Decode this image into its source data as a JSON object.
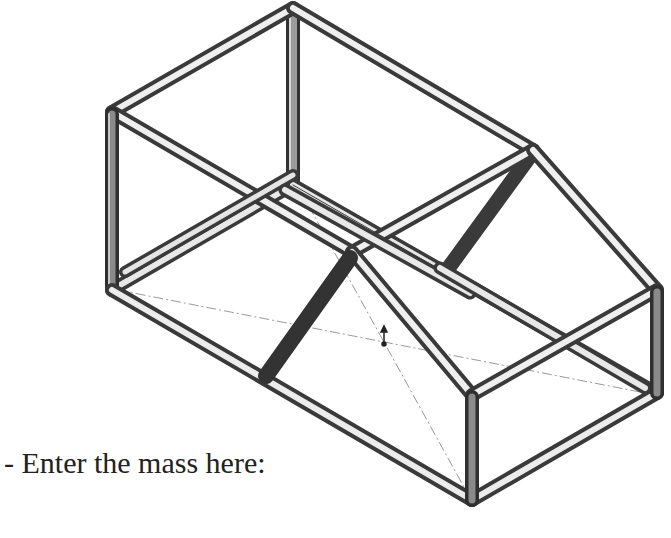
{
  "document": {
    "instruction_text": "- Enter the mass here:",
    "figure": {
      "subject": "isometric-weldment-frame",
      "description": "Tubular welded frame with a sloped roof section, shown in isometric view with reference centerlines and a center-of-mass marker",
      "colors": {
        "background": "#ffffff",
        "tube_dark": "#3a3a3a",
        "tube_mid": "#8a8a8a",
        "tube_light": "#e8e8e8",
        "centerline": "#9a9a9a",
        "text": "#222222"
      }
    }
  }
}
